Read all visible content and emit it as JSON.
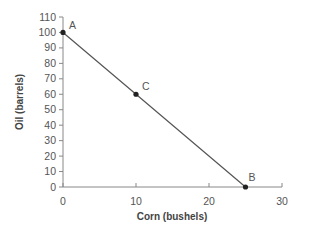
{
  "chart_data": {
    "type": "line",
    "title": "",
    "xlabel": "Corn (bushels)",
    "ylabel": "Oil (barrels)",
    "xlim": [
      0,
      30
    ],
    "ylim": [
      0,
      110
    ],
    "x_ticks": [
      0,
      10,
      20,
      30
    ],
    "y_ticks": [
      0,
      10,
      20,
      30,
      40,
      50,
      60,
      70,
      80,
      90,
      100,
      110
    ],
    "grid": false,
    "legend": null,
    "series": [
      {
        "name": "PPF",
        "x": [
          0,
          10,
          25
        ],
        "y": [
          100,
          60,
          0
        ]
      }
    ],
    "points": [
      {
        "label": "A",
        "x": 0,
        "y": 100
      },
      {
        "label": "C",
        "x": 10,
        "y": 60
      },
      {
        "label": "B",
        "x": 25,
        "y": 0
      }
    ],
    "colors": {
      "line": "#555555",
      "point": "#222222",
      "axis": "#888888"
    }
  }
}
